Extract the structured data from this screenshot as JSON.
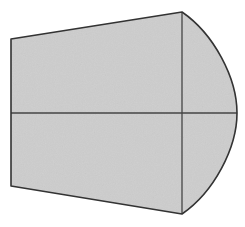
{
  "figure": {
    "background_color": "#ffffff",
    "width": 245,
    "height": 227,
    "fill_color": "#cdcdcd",
    "stroke_color": "#333333",
    "stroke_width": 1.6,
    "interior_line_color": "#444444",
    "interior_line_width": 1.3,
    "texture": "fine-grain-noise"
  },
  "geometry": {
    "vertices": {
      "top_left": [
        11,
        39
      ],
      "bottom_left": [
        11,
        186
      ],
      "top_apex": [
        182,
        12
      ],
      "bottom_apex": [
        182,
        214
      ],
      "curve_extreme_right": [
        237,
        113
      ]
    },
    "outline_path": "M 11,39 L 182,12 C 214,34 237,78 237,113 C 237,148 214,192 182,214 L 11,186 Z",
    "edges": [
      {
        "name": "top-edge",
        "type": "line",
        "from": [
          11,
          39
        ],
        "to": [
          182,
          12
        ]
      },
      {
        "name": "upper-curve",
        "type": "bezier",
        "from": [
          182,
          12
        ],
        "to": [
          237,
          113
        ]
      },
      {
        "name": "lower-curve",
        "type": "bezier",
        "from": [
          237,
          113
        ],
        "to": [
          182,
          214
        ]
      },
      {
        "name": "bottom-edge",
        "type": "line",
        "from": [
          182,
          214
        ],
        "to": [
          11,
          186
        ]
      },
      {
        "name": "left-edge",
        "type": "line",
        "from": [
          11,
          186
        ],
        "to": [
          11,
          39
        ]
      }
    ],
    "interior_lines": [
      {
        "name": "horizontal-midline",
        "from": [
          11,
          113
        ],
        "to": [
          237,
          113
        ]
      },
      {
        "name": "vertical-divider",
        "from": [
          182,
          12
        ],
        "to": [
          182,
          214
        ]
      }
    ]
  },
  "labels": {
    "text_items": []
  }
}
